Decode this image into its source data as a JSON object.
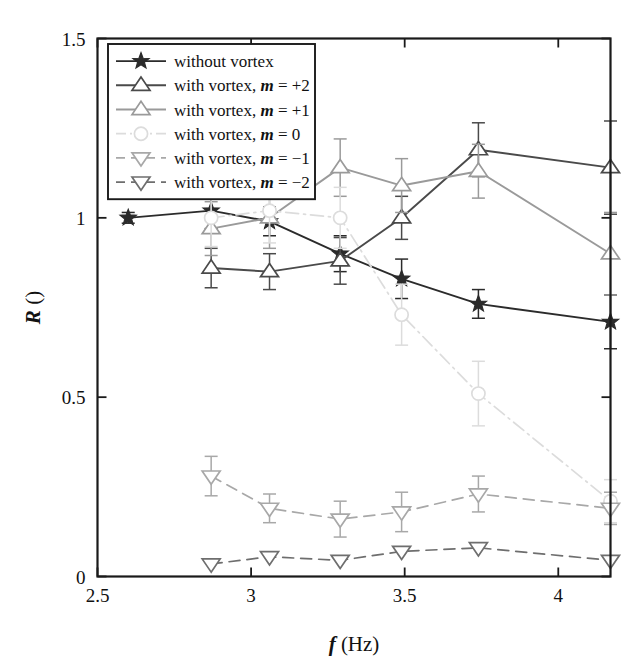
{
  "chart_data": {
    "type": "line",
    "title": "",
    "xlabel": "f (Hz)",
    "xlabel_var": "f",
    "xlabel_unit": "(Hz)",
    "ylabel": "R ()",
    "ylabel_var": "R",
    "ylabel_unit": "()",
    "xlim": [
      2.5,
      4.17
    ],
    "ylim": [
      0,
      1.5
    ],
    "xticks": [
      2.5,
      3,
      3.5,
      4
    ],
    "xtick_labels": [
      "2.5",
      "3",
      "3.5",
      "4"
    ],
    "yticks": [
      0,
      0.5,
      1,
      1.5
    ],
    "ytick_labels": [
      "0",
      "0.5",
      "1",
      "1.5"
    ],
    "grid": false,
    "legend_position": "upper-left",
    "series": [
      {
        "name": "without vortex",
        "label_prefix": "without vortex",
        "label_var": "",
        "label_suffix": "",
        "marker": "star-filled",
        "linestyle": "solid",
        "color": "#2b2b2b",
        "x": [
          2.6,
          2.87,
          3.06,
          3.29,
          3.49,
          3.74,
          4.17
        ],
        "y": [
          1.0,
          1.02,
          0.99,
          0.9,
          0.83,
          0.76,
          0.71
        ],
        "yerr": [
          0.015,
          0.05,
          0.04,
          0.05,
          0.055,
          0.04,
          0.075
        ]
      },
      {
        "name": "with vortex, m = +2",
        "label_prefix": "with vortex, ",
        "label_var": "m",
        "label_suffix": " = +2",
        "marker": "triangle-up",
        "linestyle": "solid",
        "color": "#4a4a4a",
        "x": [
          2.87,
          3.06,
          3.29,
          3.49,
          3.74,
          4.17
        ],
        "y": [
          0.86,
          0.85,
          0.88,
          1.0,
          1.19,
          1.14
        ],
        "yerr": [
          0.055,
          0.05,
          0.065,
          0.06,
          0.075,
          0.13
        ]
      },
      {
        "name": "with vortex, m = +1",
        "label_prefix": "with vortex, ",
        "label_var": "m",
        "label_suffix": " = +1",
        "marker": "triangle-up",
        "linestyle": "solid",
        "color": "#9a9a9a",
        "x": [
          2.87,
          3.06,
          3.29,
          3.49,
          3.74,
          4.17
        ],
        "y": [
          0.97,
          1.0,
          1.14,
          1.09,
          1.13,
          0.9
        ],
        "yerr": [
          0.075,
          0.085,
          0.08,
          0.075,
          0.075,
          0.115
        ]
      },
      {
        "name": "with vortex, m = 0",
        "label_prefix": "with vortex, ",
        "label_var": "m",
        "label_suffix": " = 0",
        "marker": "circle",
        "linestyle": "dashdot",
        "color": "#dcdcdc",
        "x": [
          2.87,
          3.06,
          3.29,
          3.49,
          3.74,
          4.17
        ],
        "y": [
          1.0,
          1.02,
          1.0,
          0.73,
          0.51,
          0.21
        ],
        "yerr": [
          0.08,
          0.09,
          0.085,
          0.085,
          0.09,
          0.06
        ]
      },
      {
        "name": "with vortex, m = -1",
        "label_prefix": "with vortex, ",
        "label_var": "m",
        "label_suffix": " = −1",
        "marker": "triangle-down",
        "linestyle": "dashed",
        "color": "#a8a8a8",
        "x": [
          2.87,
          3.06,
          3.29,
          3.49,
          3.74,
          4.17
        ],
        "y": [
          0.28,
          0.19,
          0.16,
          0.18,
          0.23,
          0.19
        ],
        "yerr": [
          0.055,
          0.04,
          0.05,
          0.055,
          0.05,
          0.045
        ]
      },
      {
        "name": "with vortex, m = -2",
        "label_prefix": "with vortex, ",
        "label_var": "m",
        "label_suffix": " = −2",
        "marker": "triangle-down",
        "linestyle": "dashed",
        "color": "#6e6e6e",
        "x": [
          2.87,
          3.06,
          3.29,
          3.49,
          3.74,
          4.17
        ],
        "y": [
          0.035,
          0.055,
          0.045,
          0.07,
          0.08,
          0.045
        ]
      }
    ]
  },
  "figure": {
    "background": "#ffffff",
    "axis_color": "#1a1a1a"
  }
}
